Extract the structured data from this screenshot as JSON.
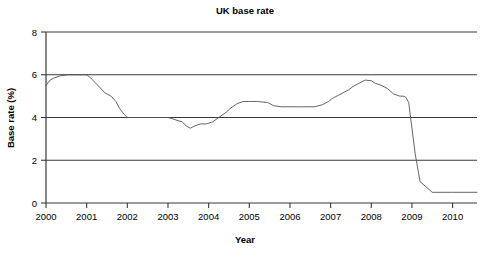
{
  "chart_data": {
    "type": "line",
    "title": "UK base rate",
    "xlabel": "Year",
    "ylabel": "Base rate (%)",
    "xlim": [
      2000,
      2010.6
    ],
    "ylim": [
      0,
      8
    ],
    "grid": true,
    "legend": "none",
    "xticks": [
      "2000",
      "2001",
      "2002",
      "2003",
      "2004",
      "2005",
      "2006",
      "2007",
      "2008",
      "2009",
      "2010"
    ],
    "xtick_values": [
      2000,
      2001,
      2002,
      2003,
      2004,
      2005,
      2006,
      2007,
      2008,
      2009,
      2010
    ],
    "yticks": [
      "0",
      "2",
      "4",
      "6",
      "8"
    ],
    "ytick_values": [
      0,
      2,
      4,
      6,
      8
    ],
    "series": [
      {
        "name": "UK base rate",
        "color": "#555555",
        "x": [
          2000.0,
          2000.1,
          2000.2,
          2000.35,
          2000.55,
          2000.8,
          2001.0,
          2001.1,
          2001.2,
          2001.3,
          2001.45,
          2001.5,
          2001.6,
          2001.72,
          2001.8,
          2001.92,
          2002.0,
          2002.5,
          2002.9,
          2003.0,
          2003.1,
          2003.25,
          2003.35,
          2003.45,
          2003.55,
          2003.65,
          2003.8,
          2003.95,
          2004.1,
          2004.25,
          2004.4,
          2004.55,
          2004.7,
          2004.85,
          2005.0,
          2005.2,
          2005.45,
          2005.6,
          2005.8,
          2006.0,
          2006.3,
          2006.6,
          2006.8,
          2006.95,
          2007.05,
          2007.2,
          2007.35,
          2007.45,
          2007.55,
          2007.7,
          2007.85,
          2008.0,
          2008.1,
          2008.25,
          2008.4,
          2008.55,
          2008.7,
          2008.78,
          2008.85,
          2008.92,
          2009.0,
          2009.08,
          2009.2,
          2009.5,
          2010.0,
          2010.6
        ],
        "y": [
          5.5,
          5.75,
          5.85,
          5.95,
          6.0,
          6.0,
          6.0,
          5.85,
          5.65,
          5.45,
          5.15,
          5.1,
          5.0,
          4.75,
          4.45,
          4.15,
          4.0,
          4.0,
          4.0,
          4.0,
          3.95,
          3.85,
          3.8,
          3.6,
          3.5,
          3.6,
          3.7,
          3.7,
          3.8,
          4.0,
          4.2,
          4.45,
          4.65,
          4.75,
          4.75,
          4.75,
          4.7,
          4.55,
          4.5,
          4.5,
          4.5,
          4.5,
          4.6,
          4.75,
          4.9,
          5.05,
          5.2,
          5.3,
          5.45,
          5.6,
          5.75,
          5.72,
          5.6,
          5.5,
          5.35,
          5.1,
          5.0,
          5.0,
          4.95,
          4.7,
          3.5,
          2.3,
          1.0,
          0.5,
          0.5,
          0.5
        ]
      }
    ]
  }
}
